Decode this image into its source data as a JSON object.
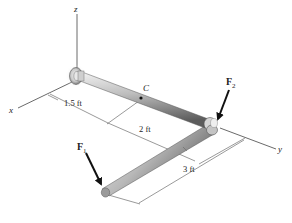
{
  "diagram": {
    "type": "3D statics pipe assembly",
    "axes": {
      "x": "x",
      "y": "y",
      "z": "z"
    },
    "point_label": "C",
    "forces": {
      "f1": {
        "symbol": "F",
        "subscript": "1"
      },
      "f2": {
        "symbol": "F",
        "subscript": "2"
      }
    },
    "dimensions": {
      "d1": "1.5 ft",
      "d2": "2 ft",
      "d3": "3 ft"
    },
    "colors": {
      "line": "#333333",
      "rod_light": "#d9d9d9",
      "rod_dark": "#6e6e6e",
      "arrow": "#111111"
    }
  }
}
